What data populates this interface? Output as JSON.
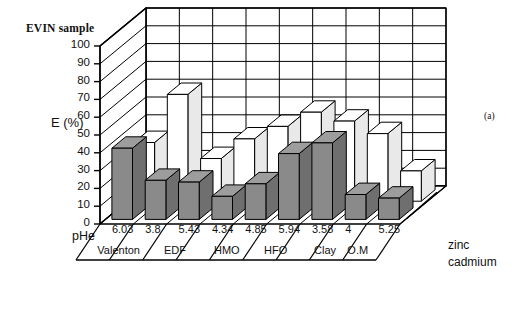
{
  "title": "EVIN sample",
  "panel_label": "(a)",
  "axis": {
    "y_title": "E (%)",
    "x_title": "pHe",
    "y_ticks": [
      "100",
      "90",
      "80",
      "70",
      "60",
      "50",
      "40",
      "30",
      "20",
      "10",
      "0"
    ]
  },
  "legend": {
    "items": [
      {
        "label": "zinc",
        "color": "#8a8a8a"
      },
      {
        "label": "cadmium",
        "color": "#ffffff"
      }
    ]
  },
  "groups": [
    {
      "name": "Valenton",
      "phe": [
        "6.03",
        "3.8"
      ]
    },
    {
      "name": "EDF",
      "phe": [
        "5.43",
        "4.34"
      ]
    },
    {
      "name": "HMO",
      "phe": [
        "4.85"
      ]
    },
    {
      "name": "HFO",
      "phe": [
        "5.94",
        "3.58"
      ]
    },
    {
      "name": "Clay",
      "phe": [
        "4"
      ]
    },
    {
      "name": "O.M",
      "phe": [
        "5.25"
      ]
    }
  ],
  "chart_data": {
    "type": "bar",
    "title": "EVIN sample",
    "xlabel": "pHe",
    "ylabel": "E (%)",
    "ylim": [
      0,
      100
    ],
    "ytick_step": 10,
    "grid": true,
    "projection": "3d",
    "legend_position": "right",
    "categories": [
      "6.03",
      "3.8",
      "5.43",
      "4.34",
      "4.85",
      "5.94",
      "3.58",
      "4",
      "5.25"
    ],
    "category_groups": [
      "Valenton",
      "Valenton",
      "EDF",
      "EDF",
      "HMO",
      "HFO",
      "HFO",
      "Clay",
      "O.M"
    ],
    "series": [
      {
        "name": "zinc",
        "color": "#8a8a8a",
        "values": [
          40,
          22,
          21,
          13,
          20,
          37,
          43,
          14,
          12
        ]
      },
      {
        "name": "cadmium",
        "color": "#ffffff",
        "values": [
          33,
          60,
          24,
          35,
          42,
          50,
          45,
          38,
          17
        ]
      }
    ]
  }
}
